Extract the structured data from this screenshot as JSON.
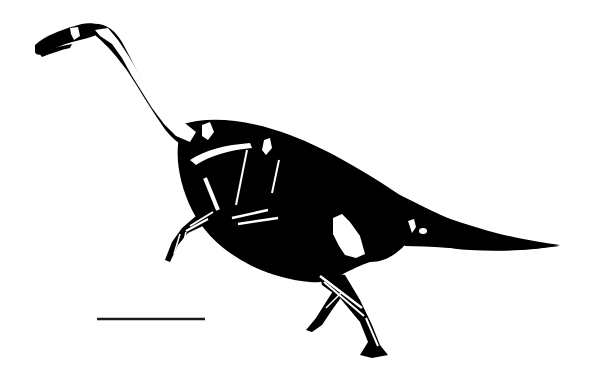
{
  "figure": {
    "colors": {
      "background": "#ffffff",
      "silhouette": "#000000",
      "bone": "#ffffff",
      "scale_bar": "#1a1a1a"
    },
    "scale_bar": {
      "label": "",
      "x1": 97,
      "x2": 205,
      "y": 319
    }
  }
}
